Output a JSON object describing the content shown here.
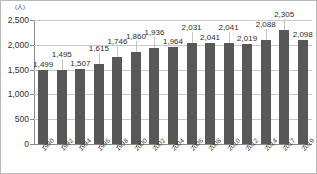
{
  "unit_label": "(人)",
  "chart_data": {
    "type": "bar",
    "title": "",
    "xlabel": "",
    "ylabel": "(人)",
    "ylim": [
      0,
      2500
    ],
    "yticks": [
      "0",
      "500",
      "1,000",
      "1,500",
      "2,000",
      "2,500"
    ],
    "ytick_values": [
      0,
      500,
      1000,
      1500,
      2000,
      2500
    ],
    "grid": true,
    "legend": "none",
    "categories": [
      "1990",
      "1992",
      "1994",
      "1996",
      "1998",
      "2000",
      "2002",
      "2004",
      "2006",
      "2008",
      "2010",
      "2012",
      "2014",
      "2017",
      "2019"
    ],
    "values": [
      1499,
      1495,
      1507,
      1615,
      1746,
      1860,
      1936,
      1964,
      2031,
      2041,
      2041,
      2019,
      2088,
      2305,
      2098
    ],
    "value_labels": [
      "1,499",
      "1,495",
      "1,507",
      "1,615",
      "1,746",
      "1,860",
      "1,936",
      "1,964",
      "2,031",
      "2,041",
      "2,041",
      "2,019",
      "2,088",
      "2,305",
      "2,098"
    ],
    "label_rows": [
      1,
      0,
      1,
      0,
      0,
      0,
      0,
      1,
      0,
      1,
      0,
      1,
      0,
      0,
      1
    ],
    "bar_color": "#575857",
    "grid_color": "#c8c8c8",
    "axis_color": "#8a8a8a",
    "text_color": "#2b2b2b"
  }
}
